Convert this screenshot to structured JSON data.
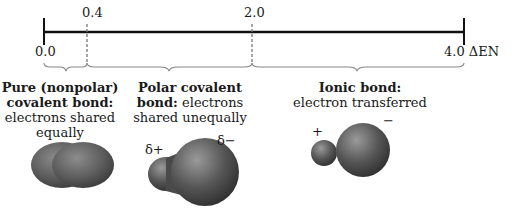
{
  "scale": {
    "axis_label": "ΔEN",
    "ticks": [
      {
        "value": "0.0",
        "x": 44
      },
      {
        "value": "0.4",
        "x": 87
      },
      {
        "value": "2.0",
        "x": 252
      },
      {
        "value": "4.0",
        "x": 464
      }
    ]
  },
  "regions": [
    {
      "name": "pure-covalent",
      "title_bold": "Pure (nonpolar) covalent bond:",
      "title_line1": "Pure (nonpolar)",
      "title_line2": "covalent bond:",
      "desc_line1": "electrons shared",
      "desc_line2": "equally",
      "charges": []
    },
    {
      "name": "polar-covalent",
      "title_line1": "Polar covalent",
      "title_line2_bold": "bond:",
      "title_line2_rest": " electrons",
      "desc_line1": "shared unequally",
      "charges": [
        "δ+",
        "δ−"
      ]
    },
    {
      "name": "ionic",
      "title_line1": "Ionic bond:",
      "desc_line1": "electron transferred",
      "charges": [
        "+",
        "−"
      ]
    }
  ],
  "colors": {
    "line": "#111111",
    "dashed": "#777777",
    "brace": "#888888",
    "blob_light": "#8a8a8a",
    "blob_dark": "#3a3a3a"
  }
}
